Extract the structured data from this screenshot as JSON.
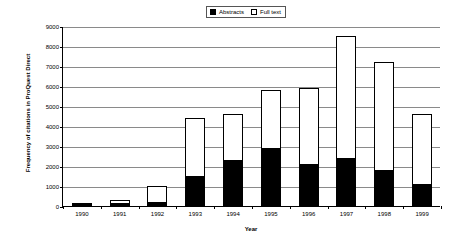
{
  "chart_data": {
    "type": "bar",
    "stacked": true,
    "title": "",
    "xlabel": "Year",
    "ylabel": "Frequency of citations in ProQuest Direct",
    "categories": [
      "1990",
      "1991",
      "1992",
      "1993",
      "1994",
      "1995",
      "1996",
      "1997",
      "1998",
      "1999"
    ],
    "series": [
      {
        "name": "Abstracts",
        "color": "#000000",
        "fill": "solid",
        "values": [
          20,
          150,
          200,
          1500,
          2300,
          2900,
          2100,
          2400,
          1800,
          1100
        ]
      },
      {
        "name": "Full text",
        "color": "#ffffff",
        "fill": "hollow",
        "values": [
          20,
          150,
          800,
          2900,
          2300,
          2900,
          3800,
          6100,
          5400,
          3500
        ]
      }
    ],
    "totals": [
      40,
      300,
      1000,
      4400,
      4600,
      5800,
      5900,
      8500,
      7200,
      4600
    ],
    "ylim": [
      0,
      9000
    ],
    "yticks": [
      0,
      1000,
      2000,
      3000,
      4000,
      5000,
      6000,
      7000,
      8000,
      9000
    ],
    "ytick_labels": [
      "0",
      "1000",
      "2000",
      "3000",
      "4000",
      "5000",
      "6000",
      "7000",
      "8000",
      "9000"
    ],
    "grid": true,
    "legend_position": "top-center"
  },
  "legend": {
    "entries": [
      {
        "label": "Abstracts",
        "swatch": "filled"
      },
      {
        "label": "Full text",
        "swatch": "hollow"
      }
    ]
  },
  "colors": {
    "abstracts": "#000000",
    "full_text": "#ffffff",
    "axis": "#000000",
    "grid": "#8a8a8a",
    "background": "#ffffff"
  }
}
